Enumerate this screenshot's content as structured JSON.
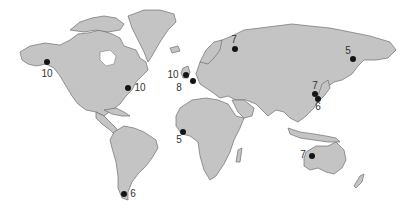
{
  "map": {
    "title": "",
    "land_color": "#c4c4c4",
    "outline_color": "#6e6e6e",
    "marker_color": "#141414",
    "points": [
      {
        "region": "Alaska",
        "value": "10",
        "x": 47,
        "y": 62,
        "lx": 47,
        "ly": 74
      },
      {
        "region": "US East Coast",
        "value": "10",
        "x": 128,
        "y": 88,
        "lx": 140,
        "ly": 88
      },
      {
        "region": "United Kingdom",
        "value": "10",
        "x": 186,
        "y": 75,
        "lx": 173,
        "ly": 75
      },
      {
        "region": "Northern France",
        "value": "8",
        "x": 193,
        "y": 81,
        "lx": 179,
        "ly": 88
      },
      {
        "region": "Northwest Russia",
        "value": "7",
        "x": 235,
        "y": 49,
        "lx": 234,
        "ly": 40
      },
      {
        "region": "Kamchatka",
        "value": "5",
        "x": 353,
        "y": 59,
        "lx": 348,
        "ly": 51
      },
      {
        "region": "Korea",
        "value": "7",
        "x": 315,
        "y": 94,
        "lx": 315,
        "ly": 86
      },
      {
        "region": "Japan",
        "value": "6",
        "x": 318,
        "y": 99,
        "lx": 318,
        "ly": 107
      },
      {
        "region": "West Africa",
        "value": "5",
        "x": 183,
        "y": 132,
        "lx": 179,
        "ly": 140
      },
      {
        "region": "Patagonia",
        "value": "6",
        "x": 124,
        "y": 194,
        "lx": 133,
        "ly": 194
      },
      {
        "region": "Northwest Australia",
        "value": "7",
        "x": 312,
        "y": 156,
        "lx": 303,
        "ly": 155
      }
    ]
  }
}
